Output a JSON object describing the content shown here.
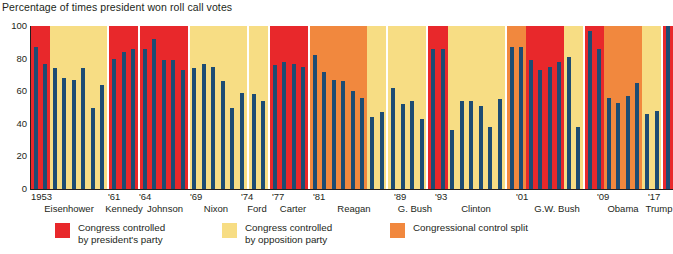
{
  "chart_title": "Percentage of times president won roll call votes",
  "legend": {
    "items": [
      {
        "key": "pres",
        "label": "Congress controlled\nby president's party",
        "color": "#e8282b",
        "left": 55
      },
      {
        "key": "opp",
        "label": "Congress controlled\nby opposition party",
        "color": "#f7dd84",
        "left": 222
      },
      {
        "key": "split",
        "label": "Congressional control split",
        "color": "#f1883e",
        "left": 390
      }
    ]
  },
  "colors": {
    "bar": "#1d4c73",
    "president_party": "#e8282b",
    "opposition_party": "#f7dd84",
    "control_split": "#f1883e",
    "axis": "#231f20",
    "background": "#ffffff"
  },
  "axis": {
    "y_ticks": [
      "100",
      "80",
      "60",
      "40",
      "20",
      "0"
    ],
    "y_values": [
      100,
      80,
      60,
      40,
      20,
      0
    ],
    "ylim": [
      0,
      100
    ],
    "year_labels": [
      {
        "text": "1953",
        "left": 31
      },
      {
        "text": "'61",
        "left": 108
      },
      {
        "text": "'64",
        "left": 139
      },
      {
        "text": "'69",
        "left": 190
      },
      {
        "text": "'74",
        "left": 241
      },
      {
        "text": "'77",
        "left": 272
      },
      {
        "text": "'81",
        "left": 313
      },
      {
        "text": "'89",
        "left": 394
      },
      {
        "text": "'93",
        "left": 435
      },
      {
        "text": "'01",
        "left": 516
      },
      {
        "text": "'09",
        "left": 597
      },
      {
        "text": "'17",
        "left": 648
      }
    ],
    "president_labels": [
      {
        "text": "Eisenhower",
        "center": 69
      },
      {
        "text": "Kennedy",
        "center": 124
      },
      {
        "text": "Johnson",
        "center": 165
      },
      {
        "text": "Nixon",
        "center": 216
      },
      {
        "text": "Ford",
        "center": 257
      },
      {
        "text": "Carter",
        "center": 293
      },
      {
        "text": "Reagan",
        "center": 354
      },
      {
        "text": "G. Bush",
        "center": 415
      },
      {
        "text": "Clinton",
        "center": 476
      },
      {
        "text": "G.W. Bush",
        "center": 557
      },
      {
        "text": "Obama",
        "center": 623
      },
      {
        "text": "Trump",
        "center": 659
      }
    ]
  },
  "chart_data": {
    "type": "bar",
    "title": "Percentage of times president won roll call votes",
    "xlabel": "",
    "ylabel": "",
    "ylim": [
      0,
      100
    ],
    "grid": false,
    "legend_position": "bottom",
    "bar_color": "#1d4c73",
    "band_legend": {
      "president_party": "Congress controlled by president's party",
      "opposition_party": "Congress controlled by opposition party",
      "control_split": "Congressional control split"
    },
    "x": [
      1953,
      1954,
      1955,
      1956,
      1957,
      1958,
      1959,
      1960,
      1961,
      1962,
      1963,
      1964,
      1965,
      1966,
      1967,
      1968,
      1969,
      1970,
      1971,
      1972,
      1973,
      1974,
      1975,
      1976,
      1977,
      1978,
      1979,
      1980,
      1981,
      1982,
      1983,
      1984,
      1985,
      1986,
      1987,
      1988,
      1989,
      1990,
      1991,
      1992,
      1993,
      1994,
      1995,
      1996,
      1997,
      1998,
      1999,
      2000,
      2001,
      2002,
      2003,
      2004,
      2005,
      2006,
      2007,
      2008,
      2009,
      2010,
      2011,
      2012,
      2013,
      2014,
      2015,
      2016,
      2017
    ],
    "values": [
      87,
      77,
      74,
      68,
      67,
      74,
      50,
      64,
      80,
      84,
      86,
      86,
      92,
      79,
      79,
      73,
      74,
      77,
      75,
      66,
      50,
      59,
      58,
      54,
      76,
      78,
      77,
      75,
      82,
      72,
      67,
      66,
      60,
      56,
      44,
      47,
      62,
      52,
      54,
      43,
      86,
      86,
      36,
      54,
      54,
      51,
      38,
      55,
      87,
      87,
      79,
      73,
      75,
      78,
      81,
      38,
      97,
      86,
      56,
      53,
      57,
      65,
      46,
      48,
      100
    ],
    "series": [
      {
        "name": "Percentage of roll call votes won by president",
        "values": [
          87,
          77,
          74,
          68,
          67,
          74,
          50,
          64,
          80,
          84,
          86,
          86,
          92,
          79,
          79,
          73,
          74,
          77,
          75,
          66,
          50,
          59,
          58,
          54,
          76,
          78,
          77,
          75,
          82,
          72,
          67,
          66,
          60,
          56,
          44,
          47,
          62,
          52,
          54,
          43,
          86,
          86,
          36,
          54,
          54,
          51,
          38,
          55,
          87,
          87,
          79,
          73,
          75,
          78,
          81,
          38,
          97,
          86,
          56,
          53,
          57,
          65,
          46,
          48,
          100
        ]
      }
    ],
    "presidents": [
      {
        "name": "Eisenhower",
        "start": 1953,
        "end": 1960,
        "bands": [
          {
            "type": "president_party",
            "years": [
              1953,
              1954
            ]
          },
          {
            "type": "opposition_party",
            "years": [
              1955,
              1960
            ]
          }
        ],
        "values": [
          87,
          77,
          74,
          68,
          67,
          74,
          50,
          64
        ]
      },
      {
        "name": "Kennedy",
        "start": 1961,
        "end": 1963,
        "bands": [
          {
            "type": "president_party",
            "years": [
              1961,
              1963
            ]
          }
        ],
        "values": [
          80,
          84,
          86
        ]
      },
      {
        "name": "Johnson",
        "start": 1964,
        "end": 1968,
        "bands": [
          {
            "type": "president_party",
            "years": [
              1964,
              1968
            ]
          }
        ],
        "values": [
          86,
          92,
          79,
          79,
          73
        ]
      },
      {
        "name": "Nixon",
        "start": 1969,
        "end": 1974,
        "bands": [
          {
            "type": "opposition_party",
            "years": [
              1969,
              1974
            ]
          }
        ],
        "values": [
          74,
          77,
          75,
          66,
          50,
          59
        ]
      },
      {
        "name": "Ford",
        "start": 1975,
        "end": 1976,
        "bands": [
          {
            "type": "opposition_party",
            "years": [
              1975,
              1976
            ]
          }
        ],
        "values": [
          58,
          54
        ]
      },
      {
        "name": "Carter",
        "start": 1977,
        "end": 1980,
        "bands": [
          {
            "type": "president_party",
            "years": [
              1977,
              1980
            ]
          }
        ],
        "values": [
          76,
          78,
          77,
          75
        ]
      },
      {
        "name": "Reagan",
        "start": 1981,
        "end": 1988,
        "bands": [
          {
            "type": "control_split",
            "years": [
              1981,
              1986
            ]
          },
          {
            "type": "opposition_party",
            "years": [
              1987,
              1988
            ]
          }
        ],
        "values": [
          82,
          72,
          67,
          66,
          60,
          56,
          44,
          47
        ]
      },
      {
        "name": "G. Bush",
        "start": 1989,
        "end": 1992,
        "bands": [
          {
            "type": "opposition_party",
            "years": [
              1989,
              1992
            ]
          }
        ],
        "values": [
          62,
          52,
          54,
          43
        ]
      },
      {
        "name": "Clinton",
        "start": 1993,
        "end": 2000,
        "bands": [
          {
            "type": "president_party",
            "years": [
              1993,
              1994
            ]
          },
          {
            "type": "opposition_party",
            "years": [
              1995,
              2000
            ]
          }
        ],
        "values": [
          86,
          86,
          36,
          54,
          54,
          51,
          38,
          55
        ]
      },
      {
        "name": "G.W. Bush",
        "start": 2001,
        "end": 2008,
        "bands": [
          {
            "type": "control_split",
            "years": [
              2001,
              2002
            ]
          },
          {
            "type": "president_party",
            "years": [
              2003,
              2006
            ]
          },
          {
            "type": "opposition_party",
            "years": [
              2007,
              2008
            ]
          }
        ],
        "values": [
          87,
          87,
          79,
          73,
          75,
          78,
          81,
          38
        ]
      },
      {
        "name": "Obama",
        "start": 2009,
        "end": 2016,
        "bands": [
          {
            "type": "president_party",
            "years": [
              2009,
              2010
            ]
          },
          {
            "type": "control_split",
            "years": [
              2011,
              2014
            ]
          },
          {
            "type": "opposition_party",
            "years": [
              2015,
              2016
            ]
          }
        ],
        "values": [
          97,
          86,
          56,
          53,
          57,
          65,
          46,
          48
        ]
      },
      {
        "name": "Trump",
        "start": 2017,
        "end": 2017,
        "bands": [
          {
            "type": "president_party",
            "years": [
              2017,
              2017
            ]
          }
        ],
        "values": [
          100
        ]
      }
    ]
  }
}
